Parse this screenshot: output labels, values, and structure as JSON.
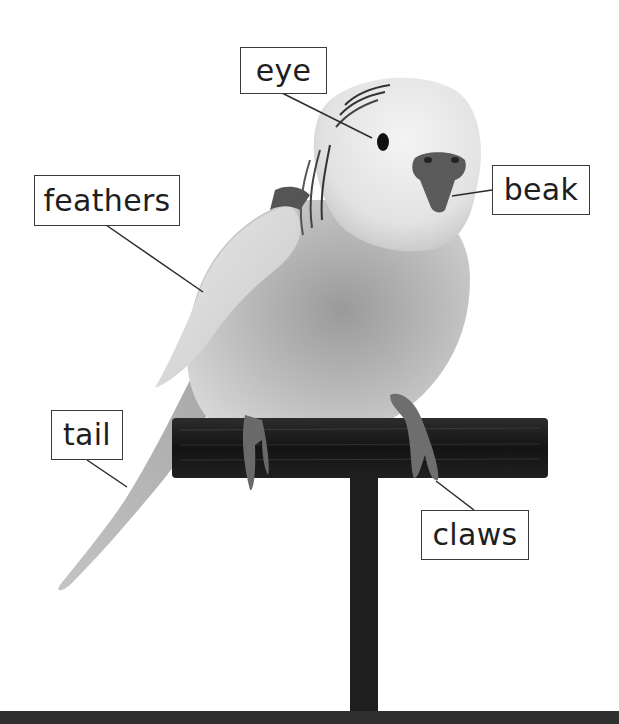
{
  "diagram": {
    "colors": {
      "background": "#ffffff",
      "label_border": "#3a3a3a",
      "label_text": "#1e1e1e",
      "leader_line": "#2a2a2a",
      "perch": "#1c1c1c",
      "bottom_band": "#2f2f2f"
    },
    "labels": [
      {
        "id": "eye",
        "text": "eye"
      },
      {
        "id": "feathers",
        "text": "feathers"
      },
      {
        "id": "beak",
        "text": "beak"
      },
      {
        "id": "tail",
        "text": "tail"
      },
      {
        "id": "claws",
        "text": "claws"
      }
    ]
  }
}
